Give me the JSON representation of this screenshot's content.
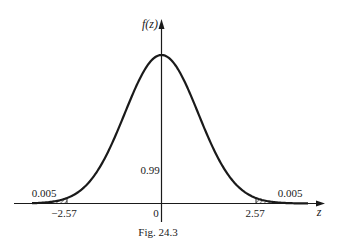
{
  "figure": {
    "caption": "Fig. 24.3",
    "y_axis_label": "f(z)",
    "x_axis_label": "z"
  },
  "chart_data": {
    "type": "area",
    "title": "",
    "subtitle": "",
    "xlabel": "z",
    "ylabel": "f(z)",
    "curve": "standard normal density",
    "x_ticks": [
      "−2.57",
      "0",
      "2.57"
    ],
    "x_tick_values": [
      -2.57,
      0,
      2.57
    ],
    "xlim": [
      -3.3,
      3.3
    ],
    "grid": false,
    "legend": null,
    "regions": [
      {
        "name": "left tail",
        "from": "-inf",
        "to": -2.57,
        "area": 0.005,
        "label": "0.005",
        "shaded": true
      },
      {
        "name": "center",
        "from": -2.57,
        "to": 2.57,
        "area": 0.99,
        "label": "0.99",
        "shaded": false
      },
      {
        "name": "right tail",
        "from": 2.57,
        "to": "inf",
        "area": 0.005,
        "label": "0.005",
        "shaded": true
      }
    ],
    "annotations": [
      "0.005",
      "0.99",
      "0.005"
    ]
  },
  "labels": {
    "left_tail_area": "0.005",
    "center_area": "0.99",
    "right_tail_area": "0.005",
    "tick_neg": "−2.57",
    "tick_zero": "0",
    "tick_pos": "2.57"
  },
  "colors": {
    "ink": "#1a1a1a",
    "background": "#ffffff"
  }
}
